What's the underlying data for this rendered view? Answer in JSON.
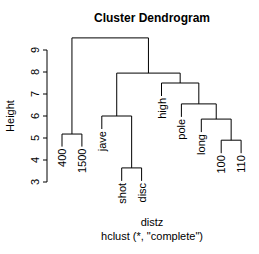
{
  "chart_data": {
    "type": "dendrogram",
    "title": "Cluster Dendrogram",
    "xlabel": "distz",
    "sub": "hclust (*, \"complete\")",
    "ylabel": "Height",
    "ylim": [
      3,
      9.55
    ],
    "yticks": [
      3,
      4,
      5,
      6,
      7,
      8,
      9
    ],
    "leaves": [
      "400",
      "1500",
      "jave",
      "shot",
      "disc",
      "high",
      "pole",
      "long",
      "100",
      "110"
    ],
    "merges": [
      {
        "id": "m1",
        "left": "leaf:3",
        "right": "leaf:4",
        "height": 3.64
      },
      {
        "id": "m2",
        "left": "leaf:8",
        "right": "leaf:9",
        "height": 4.9
      },
      {
        "id": "m3",
        "left": "leaf:0",
        "right": "leaf:1",
        "height": 5.18
      },
      {
        "id": "m4",
        "left": "leaf:7",
        "right": "m2",
        "height": 5.86
      },
      {
        "id": "m5",
        "left": "leaf:2",
        "right": "m1",
        "height": 6.0
      },
      {
        "id": "m6",
        "left": "leaf:6",
        "right": "m4",
        "height": 6.55
      },
      {
        "id": "m7",
        "left": "leaf:5",
        "right": "m6",
        "height": 7.5
      },
      {
        "id": "m8",
        "left": "m5",
        "right": "m7",
        "height": 7.95
      },
      {
        "id": "m9",
        "left": "m3",
        "right": "m8",
        "height": 9.55
      }
    ],
    "leaf_heights": [
      5.2,
      5.2,
      6.0,
      3.64,
      3.64,
      7.5,
      6.55,
      5.86,
      4.9,
      4.9
    ],
    "grid": false
  }
}
